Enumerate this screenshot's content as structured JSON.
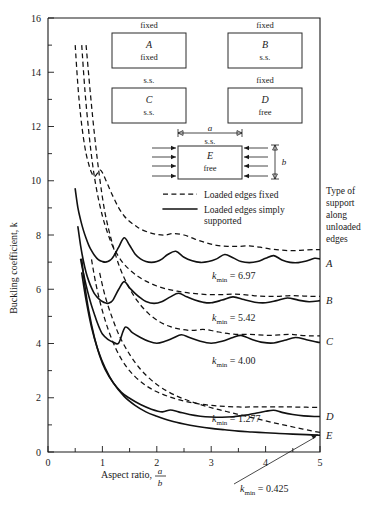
{
  "figure": {
    "title": "",
    "axis": {
      "ylabel": "Buckling coefficient, k",
      "xlabel_main": "Aspect ratio,",
      "xlabel_num": "a",
      "xlabel_den": "b",
      "ylim": [
        0,
        16
      ],
      "xlim": [
        0,
        5
      ],
      "ytick_labels": [
        "0",
        "2",
        "4",
        "6",
        "8",
        "10",
        "12",
        "14",
        "16"
      ],
      "ytick_values": [
        0,
        2,
        4,
        6,
        8,
        10,
        12,
        14,
        16
      ],
      "yminor_step": 1,
      "xtick_labels": [
        "0",
        "1",
        "2",
        "3",
        "4",
        "5"
      ],
      "xtick_values": [
        0,
        1,
        2,
        3,
        4,
        5
      ],
      "xminor_step": 0.5,
      "grid": "off"
    },
    "legend": {
      "position": "inside-upper-center",
      "entries": [
        {
          "style": "dashed",
          "label": "Loaded edges fixed"
        },
        {
          "style": "solid",
          "label_line1": "Loaded edges simply",
          "label_line2": "supported"
        }
      ]
    },
    "side_note": {
      "lines": [
        "Type of",
        "support",
        "along",
        "unloaded",
        "edges"
      ]
    },
    "plate_cases": [
      {
        "id": "A",
        "top_edge": "fixed",
        "bottom_edge": "fixed",
        "letter": "A"
      },
      {
        "id": "B",
        "top_edge": "fixed",
        "bottom_edge": "s.s.",
        "letter": "B"
      },
      {
        "id": "C",
        "top_edge": "s.s.",
        "bottom_edge": "s.s.",
        "letter": "C"
      },
      {
        "id": "D",
        "top_edge": "fixed",
        "bottom_edge": "free",
        "letter": "D"
      },
      {
        "id": "E",
        "top_edge": "s.s.",
        "bottom_edge": "free",
        "letter": "E",
        "dim_a": "a",
        "dim_b": "b"
      }
    ],
    "curve_labels": [
      {
        "letter": "A",
        "k": 6.97
      },
      {
        "letter": "B",
        "k": 5.6
      },
      {
        "letter": "C",
        "k": 4.1
      },
      {
        "letter": "D",
        "k": 1.33
      },
      {
        "letter": "E",
        "k": 0.62
      }
    ],
    "annotations": [
      {
        "text_prefix": "k",
        "sub": "min",
        "text_suffix": " = 6.97",
        "for": "A"
      },
      {
        "text_prefix": "k",
        "sub": "min",
        "text_suffix": " = 5.42",
        "for": "B"
      },
      {
        "text_prefix": "k",
        "sub": "min",
        "text_suffix": " = 4.00",
        "for": "C"
      },
      {
        "text_prefix": "k",
        "sub": "min",
        "text_suffix": " = 1.277",
        "for": "D"
      },
      {
        "text_prefix": "k",
        "sub": "min",
        "text_suffix": " = 0.425",
        "for": "E",
        "has_arrow": true
      }
    ]
  },
  "chart_data": {
    "type": "line",
    "xlabel": "Aspect ratio, a/b",
    "ylabel": "Buckling coefficient, k",
    "xlim": [
      0,
      5
    ],
    "ylim": [
      0,
      16
    ],
    "xticks": [
      0,
      1,
      2,
      3,
      4,
      5
    ],
    "yticks": [
      0,
      2,
      4,
      6,
      8,
      10,
      12,
      14,
      16
    ],
    "grid": "off",
    "legend": [
      "Loaded edges fixed",
      "Loaded edges simply supported"
    ],
    "kmin_values": {
      "A": 6.97,
      "B": 5.42,
      "C": 4.0,
      "D": 1.277,
      "E": 0.425
    },
    "series": [
      {
        "name": "A - simply supported loaded edges (fixed/fixed unloaded)",
        "style": "solid",
        "kmin": 6.97,
        "x": [
          0.5,
          0.55,
          0.6,
          0.65,
          0.7,
          0.75,
          0.8,
          0.85,
          0.9,
          0.95,
          1.0,
          1.05,
          1.1,
          1.15,
          1.2,
          1.3,
          1.4,
          1.5,
          1.6,
          1.7,
          1.8,
          1.9,
          2.0,
          2.1,
          2.2,
          2.35,
          2.5,
          2.65,
          2.8,
          2.95,
          3.1,
          3.25,
          3.4,
          3.55,
          3.7,
          3.85,
          4.0,
          4.15,
          4.3,
          4.45,
          4.6,
          4.75,
          4.9,
          5.0
        ],
        "y": [
          9.7,
          9.0,
          8.55,
          8.18,
          7.88,
          7.62,
          7.42,
          7.26,
          7.14,
          7.06,
          7.02,
          7.0,
          7.02,
          7.08,
          7.2,
          7.55,
          7.9,
          7.62,
          7.3,
          7.12,
          7.02,
          6.99,
          7.02,
          7.12,
          7.28,
          7.4,
          7.18,
          7.05,
          6.99,
          7.02,
          7.12,
          7.28,
          7.16,
          7.02,
          6.98,
          7.02,
          7.14,
          7.24,
          7.08,
          6.99,
          6.98,
          7.04,
          7.14,
          7.12
        ]
      },
      {
        "name": "A - fixed loaded edges (fixed/fixed unloaded)",
        "style": "dashed",
        "x": [
          0.5,
          0.55,
          0.6,
          0.65,
          0.7,
          0.75,
          0.8,
          0.85,
          0.9,
          0.95,
          1.0,
          1.1,
          1.2,
          1.3,
          1.4,
          1.5,
          1.6,
          1.7,
          1.85,
          2.0,
          2.15,
          2.3,
          2.5,
          2.7,
          2.9,
          3.1,
          3.3,
          3.5,
          3.7,
          3.9,
          4.1,
          4.3,
          4.5,
          4.7,
          4.9,
          5.0
        ],
        "y": [
          15.0,
          13.5,
          12.4,
          11.6,
          11.0,
          10.6,
          10.3,
          10.15,
          10.25,
          10.4,
          10.3,
          9.85,
          9.4,
          9.0,
          8.7,
          8.5,
          8.35,
          8.22,
          8.1,
          8.02,
          8.0,
          8.05,
          8.0,
          7.85,
          7.72,
          7.62,
          7.58,
          7.58,
          7.6,
          7.55,
          7.48,
          7.44,
          7.42,
          7.44,
          7.46,
          7.46
        ]
      },
      {
        "name": "B - simply supported loaded edges (fixed/s.s. unloaded)",
        "style": "solid",
        "kmin": 5.42,
        "x": [
          0.55,
          0.6,
          0.65,
          0.7,
          0.75,
          0.8,
          0.85,
          0.9,
          0.95,
          1.0,
          1.05,
          1.1,
          1.15,
          1.2,
          1.3,
          1.4,
          1.5,
          1.6,
          1.7,
          1.8,
          1.95,
          2.1,
          2.25,
          2.4,
          2.55,
          2.7,
          2.85,
          3.0,
          3.2,
          3.4,
          3.6,
          3.8,
          4.0,
          4.2,
          4.4,
          4.6,
          4.8,
          5.0
        ],
        "y": [
          8.3,
          7.6,
          7.05,
          6.62,
          6.3,
          6.05,
          5.85,
          5.72,
          5.62,
          5.55,
          5.5,
          5.48,
          5.52,
          5.62,
          6.0,
          6.28,
          6.05,
          5.85,
          5.68,
          5.55,
          5.48,
          5.55,
          5.72,
          5.85,
          5.72,
          5.6,
          5.52,
          5.5,
          5.6,
          5.72,
          5.62,
          5.52,
          5.5,
          5.58,
          5.68,
          5.6,
          5.54,
          5.58
        ]
      },
      {
        "name": "B - fixed loaded edges (fixed/s.s. unloaded)",
        "style": "dashed",
        "x": [
          0.62,
          0.68,
          0.75,
          0.82,
          0.9,
          1.0,
          1.1,
          1.2,
          1.35,
          1.5,
          1.65,
          1.8,
          2.0,
          2.2,
          2.4,
          2.6,
          2.8,
          3.0,
          3.2,
          3.4,
          3.6,
          3.8,
          4.0,
          4.2,
          4.4,
          4.6,
          4.8,
          5.0
        ],
        "y": [
          15.0,
          13.3,
          11.8,
          10.6,
          9.6,
          8.7,
          8.05,
          7.55,
          7.05,
          6.72,
          6.48,
          6.3,
          6.12,
          6.0,
          5.92,
          5.86,
          5.82,
          5.8,
          5.8,
          5.82,
          5.8,
          5.76,
          5.74,
          5.74,
          5.76,
          5.76,
          5.74,
          5.74
        ]
      },
      {
        "name": "C - simply supported loaded edges (s.s./s.s. unloaded)",
        "style": "solid",
        "kmin": 4.0,
        "x": [
          0.6,
          0.65,
          0.7,
          0.75,
          0.8,
          0.85,
          0.9,
          0.95,
          1.0,
          1.1,
          1.2,
          1.3,
          1.42,
          1.55,
          1.7,
          1.85,
          2.0,
          2.15,
          2.3,
          2.45,
          2.6,
          2.8,
          3.0,
          3.2,
          3.4,
          3.55,
          3.75,
          3.95,
          4.15,
          4.35,
          4.55,
          4.75,
          4.95,
          5.0
        ],
        "y": [
          7.1,
          6.6,
          6.15,
          5.75,
          5.4,
          5.1,
          4.8,
          4.55,
          4.35,
          4.15,
          4.05,
          4.02,
          4.6,
          4.4,
          4.22,
          4.08,
          4.01,
          4.08,
          4.2,
          4.32,
          4.22,
          4.08,
          4.01,
          4.08,
          4.22,
          4.3,
          4.15,
          4.04,
          4.02,
          4.12,
          4.22,
          4.14,
          4.05,
          4.04
        ]
      },
      {
        "name": "C - fixed loaded edges (s.s./s.s. unloaded)",
        "style": "dashed",
        "x": [
          0.7,
          0.78,
          0.86,
          0.95,
          1.05,
          1.18,
          1.32,
          1.48,
          1.65,
          1.85,
          2.05,
          2.25,
          2.45,
          2.65,
          2.85,
          3.05,
          3.25,
          3.45,
          3.65,
          3.85,
          4.05,
          4.25,
          4.45,
          4.65,
          4.85,
          5.0
        ],
        "y": [
          15.0,
          13.2,
          11.6,
          10.1,
          8.8,
          7.7,
          6.8,
          6.1,
          5.55,
          5.1,
          4.8,
          4.62,
          4.52,
          4.48,
          4.52,
          4.46,
          4.38,
          4.34,
          4.34,
          4.32,
          4.3,
          4.32,
          4.34,
          4.3,
          4.28,
          4.28
        ]
      },
      {
        "name": "D - simply supported loaded edges (fixed/free unloaded)",
        "style": "solid",
        "kmin": 1.277,
        "x": [
          0.62,
          0.68,
          0.75,
          0.85,
          0.95,
          1.05,
          1.2,
          1.35,
          1.5,
          1.7,
          1.9,
          2.1,
          2.25,
          2.4,
          2.6,
          2.8,
          3.0,
          3.2,
          3.4,
          3.6,
          3.8,
          4.0,
          4.15,
          4.3,
          4.5,
          4.7,
          4.9,
          5.0
        ],
        "y": [
          7.1,
          6.1,
          5.2,
          4.25,
          3.55,
          3.05,
          2.55,
          2.2,
          1.98,
          1.75,
          1.58,
          1.48,
          1.55,
          1.48,
          1.38,
          1.32,
          1.29,
          1.28,
          1.3,
          1.35,
          1.42,
          1.5,
          1.54,
          1.46,
          1.38,
          1.33,
          1.31,
          1.31
        ]
      },
      {
        "name": "D - fixed loaded edges (fixed/free unloaded)",
        "style": "dashed",
        "x": [
          0.8,
          0.88,
          0.98,
          1.1,
          1.25,
          1.42,
          1.6,
          1.8,
          2.0,
          2.25,
          2.5,
          2.75,
          3.0,
          3.25,
          3.5,
          3.75,
          4.0,
          4.25,
          4.5,
          4.75,
          5.0
        ],
        "y": [
          7.1,
          6.2,
          5.35,
          4.55,
          3.8,
          3.2,
          2.78,
          2.45,
          2.22,
          2.02,
          1.88,
          1.78,
          1.72,
          1.68,
          1.66,
          1.66,
          1.66,
          1.66,
          1.66,
          1.65,
          1.64
        ]
      },
      {
        "name": "E - simply supported loaded edges (s.s./free unloaded)",
        "style": "solid",
        "kmin": 0.425,
        "x": [
          0.62,
          0.7,
          0.8,
          0.92,
          1.05,
          1.2,
          1.4,
          1.6,
          1.8,
          2.0,
          2.25,
          2.5,
          2.75,
          3.0,
          3.25,
          3.5,
          3.75,
          4.0,
          4.25,
          4.5,
          4.75,
          5.0
        ],
        "y": [
          6.6,
          5.6,
          4.6,
          3.75,
          3.1,
          2.55,
          2.05,
          1.72,
          1.48,
          1.32,
          1.15,
          1.03,
          0.94,
          0.87,
          0.82,
          0.77,
          0.74,
          0.71,
          0.68,
          0.66,
          0.64,
          0.62
        ]
      },
      {
        "name": "E - fixed loaded edges (s.s./free unloaded)",
        "style": "dashed",
        "x": [
          0.95,
          1.05,
          1.18,
          1.32,
          1.5,
          1.7,
          1.9,
          2.1,
          2.35,
          2.6,
          2.85,
          3.1,
          3.35,
          3.6,
          3.85,
          4.1,
          4.35,
          4.6,
          4.85,
          5.0
        ],
        "y": [
          6.6,
          5.75,
          4.95,
          4.25,
          3.6,
          3.05,
          2.65,
          2.35,
          2.08,
          1.88,
          1.72,
          1.58,
          1.46,
          1.34,
          1.22,
          1.1,
          0.99,
          0.88,
          0.78,
          0.72
        ]
      }
    ]
  }
}
